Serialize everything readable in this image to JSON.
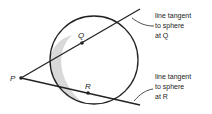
{
  "diagram": {
    "points": {
      "P": "P",
      "Q": "Q",
      "R": "R"
    },
    "annotations": {
      "tangent_q": [
        "line tangent",
        "to sphere",
        "at Q"
      ],
      "tangent_r": [
        "line tangent",
        "to sphere",
        "at R"
      ]
    },
    "colors": {
      "stroke": "#222222",
      "shading": "#d9d9d9"
    }
  }
}
